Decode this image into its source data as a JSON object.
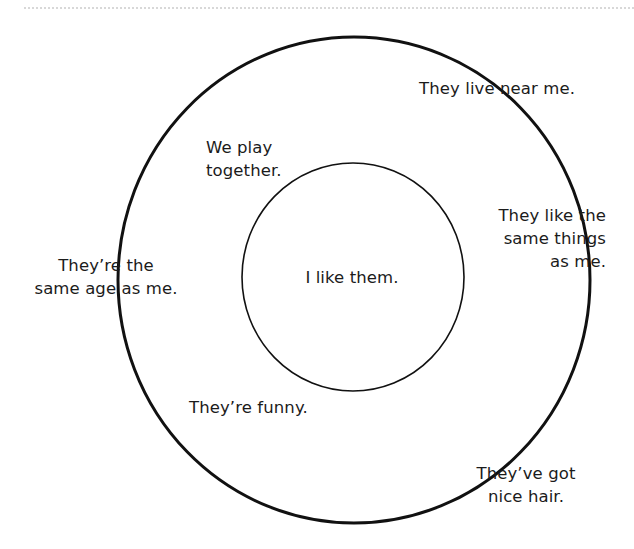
{
  "page": {
    "background_color": "#ffffff",
    "ink_color": "#1b1b1b",
    "divider_color": "#d8d8d8"
  },
  "diagram": {
    "type": "concentric-circles",
    "outer_circle": {
      "name": "friendship-outer-circle",
      "cx": 354,
      "cy": 280,
      "rx": 236,
      "ry": 243,
      "stroke_width": 3,
      "stroke_color": "#111111",
      "fill": "none"
    },
    "inner_circle": {
      "name": "friendship-inner-circle",
      "cx": 353,
      "cy": 277,
      "rx": 111,
      "ry": 114,
      "stroke_width": 1.6,
      "stroke_color": "#111111",
      "fill": "none"
    }
  },
  "labels": {
    "core": "I like them.",
    "live_near": "They live near me.",
    "play_together": "We play\ntogether.",
    "same_things": "They like the\nsame things\nas me.",
    "same_age": "They’re the\nsame age as me.",
    "funny": "They’re funny.",
    "nice_hair": "They’ve got\nnice hair."
  }
}
